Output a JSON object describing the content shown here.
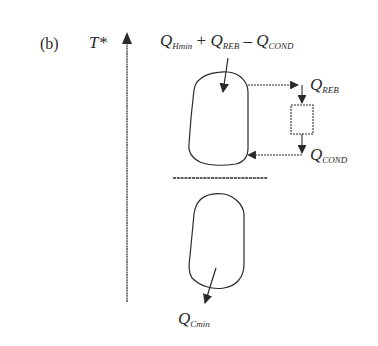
{
  "panel_label": "(b)",
  "axis": {
    "label": "T*"
  },
  "labels": {
    "top": {
      "q1": "Q",
      "q1_sub": "Hmin",
      "plus": " + ",
      "q2": "Q",
      "q2_sub": "REB",
      "minus": " – ",
      "q3": "Q",
      "q3_sub": "COND"
    },
    "reb": {
      "q": "Q",
      "sub": "REB"
    },
    "cond": {
      "q": "Q",
      "sub": "COND"
    },
    "cmin": {
      "q": "Q",
      "sub": "Cmin"
    }
  },
  "colors": {
    "stroke": "#2a2a2a",
    "background": "#ffffff"
  }
}
